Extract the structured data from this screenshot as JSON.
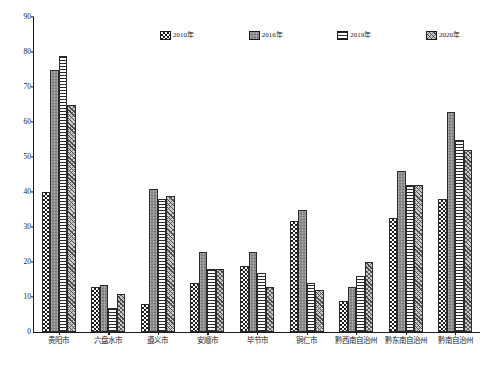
{
  "chart_data": {
    "type": "bar",
    "title": "",
    "xlabel": "",
    "ylabel": "",
    "ylim": [
      0,
      90
    ],
    "ytick_step": 10,
    "yticks": [
      0,
      10,
      20,
      30,
      40,
      50,
      60,
      70,
      80,
      90
    ],
    "grid": false,
    "legend_position": "top-center",
    "categories": [
      "贵阳市",
      "六盘水市",
      "遵义市",
      "安顺市",
      "毕节市",
      "铜仁市",
      "黔西南自治州",
      "黔东南自治州",
      "黔南自治州"
    ],
    "series": [
      {
        "name": "2010年",
        "pattern": "checker",
        "values": [
          40.0,
          13.0,
          8.0,
          14.0,
          19.0,
          31.7,
          9.0,
          32.7,
          38.0
        ]
      },
      {
        "name": "2016年",
        "pattern": "solid-gray",
        "values": [
          75.0,
          13.5,
          41.0,
          23.0,
          23.0,
          35.0,
          13.0,
          46.0,
          63.0
        ]
      },
      {
        "name": "2019年",
        "pattern": "horizontal-dash",
        "values": [
          79.0,
          7.0,
          38.0,
          18.0,
          17.0,
          14.0,
          16.0,
          42.0,
          55.0
        ]
      },
      {
        "name": "2020年",
        "pattern": "diagonal-hatch",
        "values": [
          65.0,
          11.0,
          39.0,
          18.0,
          13.0,
          12.0,
          20.0,
          42.0,
          52.0
        ]
      }
    ]
  },
  "legend": {
    "items": [
      {
        "label": "2010年",
        "pattern": "checker"
      },
      {
        "label": "2016年",
        "pattern": "solid-gray"
      },
      {
        "label": "2019年",
        "pattern": "horizontal-dash"
      },
      {
        "label": "2020年",
        "pattern": "diagonal-hatch"
      }
    ]
  },
  "axis": {
    "y_max_label": "90",
    "y_min_label": "0"
  }
}
